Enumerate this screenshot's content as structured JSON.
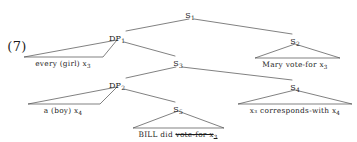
{
  "figure": {
    "example_number": "(7)",
    "kind": "syntax-tree",
    "width": 357,
    "height": 142,
    "line_color": "#4a4a4a",
    "text_color": "#1b1b1b",
    "background": "#ffffff"
  },
  "nodes": [
    {
      "id": "S1",
      "label": "S",
      "subscript": "1",
      "x": 190,
      "y": 12
    },
    {
      "id": "DP1",
      "label": "DP",
      "subscript": "1",
      "x": 117,
      "y": 35
    },
    {
      "id": "S2",
      "label": "S",
      "subscript": "2",
      "x": 295,
      "y": 38
    },
    {
      "id": "S3",
      "label": "S",
      "subscript": "3",
      "x": 178,
      "y": 60
    },
    {
      "id": "DP2",
      "label": "DP",
      "subscript": "2",
      "x": 117,
      "y": 82
    },
    {
      "id": "S4",
      "label": "S",
      "subscript": "4",
      "x": 295,
      "y": 84
    },
    {
      "id": "S5",
      "label": "S",
      "subscript": "5",
      "x": 178,
      "y": 106
    }
  ],
  "leaves": [
    {
      "id": "leaf-every-girl",
      "parent": "DP1",
      "text": "every (girl)  x",
      "subscript": "3",
      "struck": false,
      "x": 63,
      "y": 60,
      "triangle": {
        "left": 24,
        "right": 103,
        "apex_x": 117,
        "apex_y": 40,
        "base_y": 57
      }
    },
    {
      "id": "leaf-mary-vote-for",
      "parent": "S2",
      "text": "Mary vote-for x",
      "subscript": "3",
      "struck": false,
      "x": 295,
      "y": 61,
      "triangle": {
        "left": 255,
        "right": 340,
        "apex_x": 295,
        "apex_y": 44,
        "base_y": 58
      }
    },
    {
      "id": "leaf-a-boy",
      "parent": "DP2",
      "text": "a (boy)  x",
      "subscript": "4",
      "struck": false,
      "x": 63,
      "y": 107,
      "triangle": {
        "left": 28,
        "right": 100,
        "apex_x": 117,
        "apex_y": 87,
        "base_y": 104
      }
    },
    {
      "id": "leaf-x3-corresponds-with-x4",
      "parent": "S4",
      "text": "x₃ corresponds-with x",
      "subscript": "4",
      "struck": false,
      "x": 295,
      "y": 107,
      "triangle": {
        "left": 238,
        "right": 352,
        "apex_x": 295,
        "apex_y": 90,
        "base_y": 104
      }
    },
    {
      "id": "leaf-bill-did",
      "parent": "S5",
      "text": "BILL did ",
      "subscript": "",
      "struck": false,
      "struck_text": "vote-for x",
      "struck_subscript": "3",
      "x": 178,
      "y": 131,
      "triangle": {
        "left": 133,
        "right": 224,
        "apex_x": 178,
        "apex_y": 111,
        "base_y": 128
      }
    }
  ],
  "branches": [
    {
      "from": "S1",
      "to": "DP1",
      "x1": 189,
      "y1": 19,
      "x2": 126,
      "y2": 31
    },
    {
      "from": "S1",
      "to": "S2",
      "x1": 194,
      "y1": 19,
      "x2": 292,
      "y2": 34
    },
    {
      "from": "DP1",
      "to": "S3",
      "x1": 124,
      "y1": 42,
      "x2": 175,
      "y2": 56
    },
    {
      "from": "S3",
      "to": "DP2",
      "x1": 176,
      "y1": 67,
      "x2": 126,
      "y2": 78
    },
    {
      "from": "S3",
      "to": "S4",
      "x1": 182,
      "y1": 67,
      "x2": 292,
      "y2": 80
    },
    {
      "from": "DP2",
      "to": "S5",
      "x1": 124,
      "y1": 89,
      "x2": 175,
      "y2": 102
    }
  ],
  "accessibility": {
    "description": "Syntax tree for example (7)"
  }
}
